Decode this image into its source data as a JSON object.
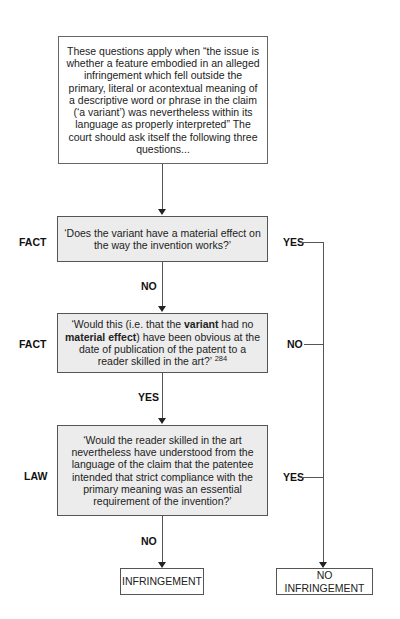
{
  "intro_box": {
    "text": "These questions apply when “the issue is whether a feature embodied in an alleged infringement which fell outside the primary, literal or acontextual meaning of a descriptive word or phrase in the claim (‘a variant’) was nevertheless within its language as properly interpreted” The court should ask itself the following three questions..."
  },
  "questions": [
    {
      "type_label": "FACT",
      "text": "‘Does the variant have a material effect on the way the invention works?’",
      "down_label": "NO",
      "side_label": "YES"
    },
    {
      "type_label": "FACT",
      "text_parts": {
        "p1": "‘Would this (i.e. that the ",
        "b1": "variant",
        "p2": " had no ",
        "b2": "material effect",
        "p3": ") have been obvious at the date of publication of the patent to a reader skilled in the art?’ ",
        "footnote": "284"
      },
      "down_label": "YES",
      "side_label": "NO"
    },
    {
      "type_label": "LAW",
      "text": "‘Would the reader skilled in the art nevertheless have understood from the language of the claim that the patentee intended that strict compliance with the primary meaning was an essential requirement of the invention?’",
      "down_label": "NO",
      "side_label": "YES"
    }
  ],
  "outcomes": {
    "infringement": "INFRINGEMENT",
    "no_infringement": "NO INFRINGEMENT"
  },
  "colors": {
    "question_fill": "#ececec",
    "border": "#555555",
    "background": "#ffffff"
  }
}
